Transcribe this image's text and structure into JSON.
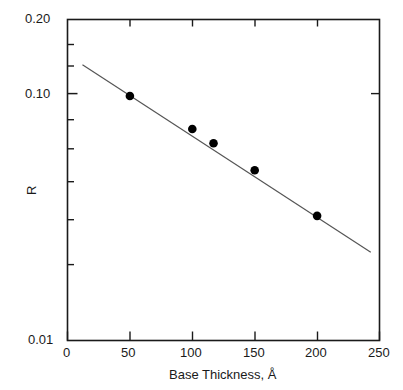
{
  "chart_data": {
    "type": "scatter",
    "title": "",
    "xlabel": "Base Thickness, Å",
    "ylabel": "R",
    "xlim": [
      0,
      250
    ],
    "ylim": [
      0.01,
      0.2
    ],
    "yscale": "log",
    "xscale": "linear",
    "grid": false,
    "legend": null,
    "xticks": [
      0,
      50,
      100,
      150,
      200,
      250
    ],
    "xtick_labels": [
      "0",
      "50",
      "100",
      "150",
      "200",
      "250"
    ],
    "yticks": [
      0.01,
      0.1,
      0.2
    ],
    "ytick_labels": [
      "0.01",
      "0.10",
      "0.20"
    ],
    "yminor_ticks": [
      0.02,
      0.03,
      0.04,
      0.05,
      0.06,
      0.07,
      0.08,
      0.09,
      0.2
    ],
    "series": [
      {
        "name": "R vs Base Thickness",
        "marker": "filled-circle",
        "color": "#000000",
        "points": [
          {
            "x": 50,
            "y": 0.098
          },
          {
            "x": 100,
            "y": 0.072
          },
          {
            "x": 117,
            "y": 0.063
          },
          {
            "x": 150,
            "y": 0.049
          },
          {
            "x": 200,
            "y": 0.032
          }
        ]
      }
    ],
    "fit_line": {
      "name": "linear fit (semi-log)",
      "color": "#555555",
      "x_start": 12,
      "y_start": 0.131,
      "x_end": 243,
      "y_end": 0.0228
    }
  },
  "axis": {
    "x_tick_labels": [
      "0",
      "50",
      "100",
      "150",
      "200",
      "250"
    ],
    "y_tick_labels": [
      "0.20",
      "0.10",
      "0.01"
    ],
    "x_title": "Base Thickness, Å",
    "y_title": "R"
  }
}
